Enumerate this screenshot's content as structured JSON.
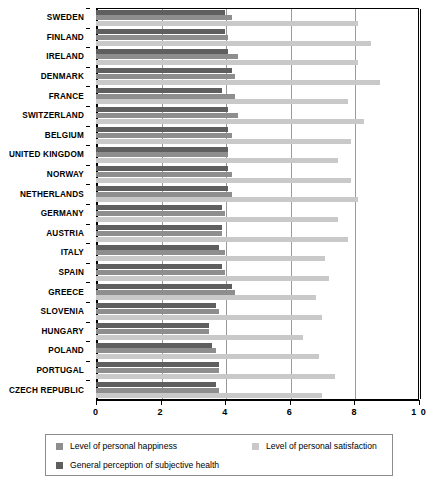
{
  "chart_data": {
    "type": "bar",
    "orientation": "horizontal",
    "title": "",
    "xlabel": "",
    "ylabel": "",
    "xlim": [
      0,
      10
    ],
    "xticks": [
      0,
      2,
      4,
      6,
      8,
      10
    ],
    "xtick_labels": [
      "0",
      "2",
      "4",
      "6",
      "8",
      "1 0"
    ],
    "grid": true,
    "grid_axis": "x",
    "legend_position": "bottom",
    "categories": [
      "SWEDEN",
      "FINLAND",
      "IRELAND",
      "DENMARK",
      "FRANCE",
      "SWITZERLAND",
      "BELGIUM",
      "UNITED KINGDOM",
      "NORWAY",
      "NETHERLANDS",
      "GERMANY",
      "AUSTRIA",
      "ITALY",
      "SPAIN",
      "GREECE",
      "SLOVENIA",
      "HUNGARY",
      "POLAND",
      "PORTUGAL",
      "CZECH REPUBLIC"
    ],
    "series": [
      {
        "name": "Level of personal happiness",
        "color": "#8e8e8e",
        "values": [
          4.2,
          4.1,
          4.4,
          4.3,
          4.3,
          4.4,
          4.2,
          4.1,
          4.2,
          4.2,
          4.0,
          3.9,
          4.0,
          4.0,
          4.3,
          3.8,
          3.5,
          3.7,
          3.8,
          3.8
        ]
      },
      {
        "name": "Level of personal satisfaction",
        "color": "#c9c9c9",
        "values": [
          8.1,
          8.5,
          8.1,
          8.8,
          7.8,
          8.3,
          7.9,
          7.5,
          7.9,
          8.1,
          7.5,
          7.8,
          7.1,
          7.2,
          6.8,
          7.0,
          6.4,
          6.9,
          7.4,
          7.0
        ]
      },
      {
        "name": "General perception of subjective health",
        "color": "#5f5f5f",
        "values": [
          4.0,
          4.0,
          4.1,
          4.2,
          3.9,
          4.1,
          4.1,
          4.1,
          4.1,
          4.1,
          3.9,
          3.9,
          3.8,
          3.9,
          4.2,
          3.7,
          3.5,
          3.6,
          3.8,
          3.7
        ]
      }
    ]
  },
  "legend": {
    "items": [
      {
        "label": "Level of personal happiness",
        "series": "s-happiness"
      },
      {
        "label": "Level of personal satisfaction",
        "series": "s-satisfaction"
      },
      {
        "label": "General perception of subjective health",
        "series": "s-health"
      }
    ]
  }
}
